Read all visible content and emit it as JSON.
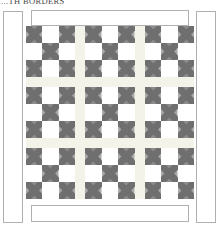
{
  "title": "...TH BORDERS",
  "diagram": {
    "kind": "quilt-layout",
    "label_top": "...TH BORDERS",
    "colors": {
      "background": "#ffffff",
      "sashing": "#f4f3ea",
      "patch_light": "#ffffff",
      "patch_dark": "#8c8c8c",
      "patch_mid": "#a8a8a8",
      "patch_shadow": "#6f6f6f",
      "outline": "#b0b0b0",
      "seam": "#c9c9c4",
      "title_text": "#4a4a4a"
    },
    "borders": [
      {
        "name": "left-border",
        "label": "Left side border",
        "orientation": "vertical"
      },
      {
        "name": "right-border",
        "label": "Right side border",
        "orientation": "vertical"
      },
      {
        "name": "top-border",
        "label": "Top border",
        "orientation": "horizontal"
      },
      {
        "name": "bottom-border",
        "label": "Bottom border",
        "orientation": "horizontal"
      }
    ],
    "center": {
      "block_rows": 3,
      "block_cols": 3,
      "block_count": 9,
      "block_name": "nine-patch-with-hourglass",
      "patch_rows": 3,
      "patch_cols": 3,
      "sashing_rows": 2,
      "sashing_cols": 2,
      "patch_layout": [
        [
          "x",
          "plain",
          "x"
        ],
        [
          "plain",
          "x",
          "plain"
        ],
        [
          "x",
          "plain",
          "x"
        ]
      ]
    }
  }
}
